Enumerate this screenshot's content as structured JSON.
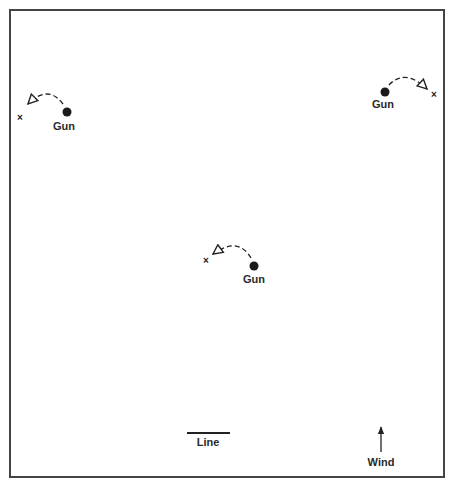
{
  "figure": {
    "frame": {
      "x": 10,
      "y": 10,
      "width": 434,
      "height": 467,
      "stroke": "#444444"
    },
    "ink_color": "#222222"
  },
  "guns": [
    {
      "label": "Gun",
      "dot": {
        "x": 67,
        "y": 112
      },
      "label_pos": {
        "x": 64,
        "y": 130
      },
      "arc_path": "M 63 104 Q 50 86 31 102",
      "arrowhead": {
        "tip": {
          "x": 25,
          "y": 108
        },
        "direction": "down-left"
      },
      "target_x": {
        "x": 20,
        "y": 117
      }
    },
    {
      "label": "Gun",
      "dot": {
        "x": 385,
        "y": 92
      },
      "label_pos": {
        "x": 383,
        "y": 108
      },
      "arc_path": "M 389 85 Q 404 70 421 84",
      "arrowhead": {
        "tip": {
          "x": 428,
          "y": 91
        },
        "direction": "down-right"
      },
      "target_x": {
        "x": 433,
        "y": 95
      }
    },
    {
      "label": "Gun",
      "dot": {
        "x": 254,
        "y": 266
      },
      "label_pos": {
        "x": 254,
        "y": 283
      },
      "arc_path": "M 251 258 Q 240 238 220 250",
      "arrowhead": {
        "tip": {
          "x": 213,
          "y": 256
        },
        "direction": "left"
      },
      "target_x": {
        "x": 206,
        "y": 261
      }
    }
  ],
  "scale": {
    "label": "Line",
    "line": {
      "x1": 187,
      "x2": 230,
      "y": 433
    },
    "label_pos": {
      "x": 208,
      "y": 446
    }
  },
  "wind": {
    "label": "Wind",
    "arrow": {
      "x": 381,
      "y_from": 452,
      "y_to": 426
    },
    "label_pos": {
      "x": 381,
      "y": 466
    }
  }
}
